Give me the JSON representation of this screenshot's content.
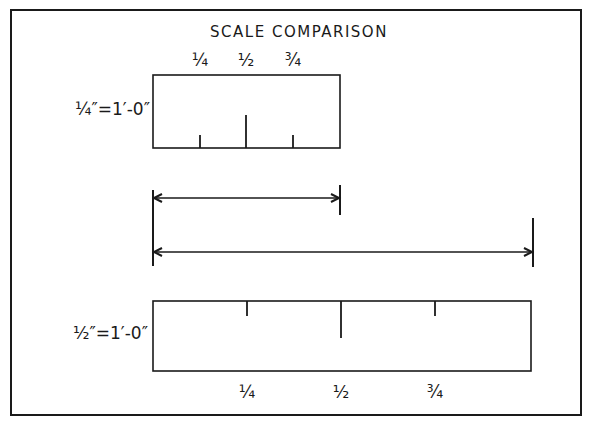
{
  "diagram": {
    "title": "SCALE COMPARISON",
    "colors": {
      "ink": "#1a1a1a",
      "paper": "#ffffff"
    },
    "frame": {
      "x": 11,
      "y": 10,
      "w": 570,
      "h": 405
    },
    "scales": [
      {
        "id": "quarter-inch",
        "label": "1/4\" = 1'-0\"",
        "label_display": "¼″=1′-0″",
        "box": {
          "x": 153,
          "y": 75,
          "w": 187,
          "h": 73
        },
        "ticks_from": "bottom",
        "ticks": [
          {
            "fraction": "1/4",
            "display": "¼",
            "x": 200,
            "length": 13
          },
          {
            "fraction": "1/2",
            "display": "½",
            "x": 246,
            "length": 33
          },
          {
            "fraction": "3/4",
            "display": "¾",
            "x": 293,
            "length": 13
          }
        ],
        "tick_labels_position": "above",
        "tick_label_y": 66,
        "label_pos": {
          "x": 150,
          "y": 115
        }
      },
      {
        "id": "half-inch",
        "label": "1/2\" = 1'-0\"",
        "label_display": "½″=1′-0″",
        "box": {
          "x": 153,
          "y": 301,
          "w": 378,
          "h": 70
        },
        "ticks_from": "top",
        "ticks": [
          {
            "fraction": "1/4",
            "display": "¼",
            "x": 247,
            "length": 15
          },
          {
            "fraction": "1/2",
            "display": "½",
            "x": 341,
            "length": 37
          },
          {
            "fraction": "3/4",
            "display": "¾",
            "x": 435,
            "length": 15
          }
        ],
        "tick_labels_position": "below",
        "tick_label_y": 398,
        "label_pos": {
          "x": 148,
          "y": 339
        }
      }
    ],
    "dimension_lines": [
      {
        "id": "one-foot-at-quarter-scale",
        "x1": 153,
        "x2": 340,
        "y": 198,
        "ext_left": [
          190,
          266
        ],
        "ext_right": [
          185,
          215
        ]
      },
      {
        "id": "one-foot-at-half-scale",
        "x1": 153,
        "x2": 533,
        "y": 252,
        "ext_left": [
          190,
          266
        ],
        "ext_right": [
          218,
          267
        ]
      }
    ]
  }
}
